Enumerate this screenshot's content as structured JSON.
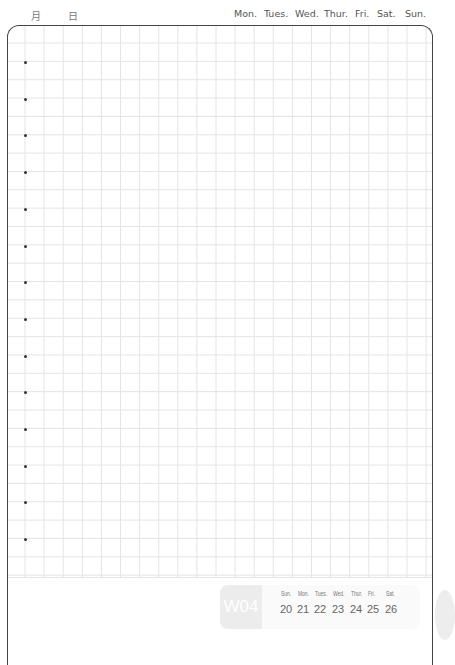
{
  "header": {
    "month_label": "月",
    "day_label": "日",
    "weekdays": [
      "Mon.",
      "Tues.",
      "Wed.",
      "Thur.",
      "Fri.",
      "Sat.",
      "Sun."
    ]
  },
  "grid": {
    "bullet_count": 14
  },
  "week_box": {
    "week_number": "W04",
    "days": [
      {
        "name": "Sun.",
        "date": "20"
      },
      {
        "name": "Mon.",
        "date": "21"
      },
      {
        "name": "Tues.",
        "date": "22"
      },
      {
        "name": "Wed.",
        "date": "23"
      },
      {
        "name": "Thur.",
        "date": "24"
      },
      {
        "name": "Fri.",
        "date": "25"
      },
      {
        "name": "Sat.",
        "date": "26"
      }
    ]
  }
}
